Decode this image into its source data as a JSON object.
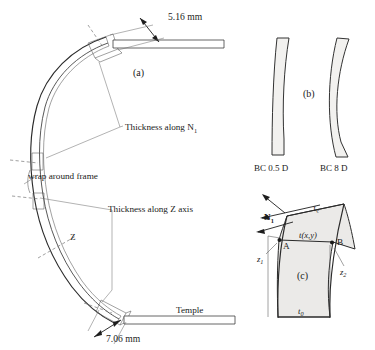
{
  "figure": {
    "title_clipped": "",
    "panels": {
      "a": {
        "label": "(a)",
        "annotations": {
          "dim_top": "5.16 mm",
          "dim_bottom": "7.06 mm",
          "thickness_n1": "Thickness along N",
          "thickness_n1_sub": "1",
          "wrap_frame": "wrap around frame",
          "thickness_z": "Thickness along Z axis",
          "z_axis": "Z",
          "temple": "Temple"
        }
      },
      "b": {
        "label": "(b)",
        "lenses": [
          {
            "caption": "BC 0.5 D"
          },
          {
            "caption": "BC 8 D"
          }
        ]
      },
      "c": {
        "label": "(c)",
        "annotations": {
          "normal_vector": "N",
          "normal_vector_sub": "1",
          "edge_thickness": "t",
          "edge_thickness_sub": "e",
          "local_thickness": "t(x,y)",
          "point_a": "A",
          "point_b": "B",
          "sag_left": "z",
          "sag_left_sub": "1",
          "sag_right": "z",
          "sag_right_sub": "2",
          "center_thickness": "t",
          "center_thickness_sub": "0"
        }
      }
    }
  },
  "colors": {
    "ink": "#1a1a1a",
    "stroke_main": "#2b2b2b",
    "stroke_thin": "#555555",
    "lens_fill": "#f2f1ef",
    "panelc_fill": "#ebeae8",
    "background": "#ffffff"
  }
}
